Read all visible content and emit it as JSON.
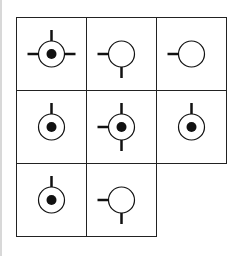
{
  "puzzle": {
    "grid": {
      "rows": 3,
      "cols": 3,
      "origin": [
        16,
        17
      ],
      "cell_w": 70,
      "cell_h": 73
    },
    "colors": {
      "line": "#222222",
      "stroke": "#111111",
      "dot": "#111111",
      "background": "#ffffff"
    },
    "cells": [
      {
        "row": 0,
        "col": 0,
        "dot": true,
        "stubs": [
          "top",
          "left",
          "right"
        ]
      },
      {
        "row": 0,
        "col": 1,
        "dot": false,
        "stubs": [
          "left",
          "bottom"
        ]
      },
      {
        "row": 0,
        "col": 2,
        "dot": false,
        "stubs": [
          "left"
        ]
      },
      {
        "row": 1,
        "col": 0,
        "dot": true,
        "stubs": [
          "top"
        ]
      },
      {
        "row": 1,
        "col": 1,
        "dot": true,
        "stubs": [
          "top",
          "left",
          "bottom"
        ]
      },
      {
        "row": 1,
        "col": 2,
        "dot": true,
        "stubs": [
          "top"
        ]
      },
      {
        "row": 2,
        "col": 0,
        "dot": true,
        "stubs": [
          "top"
        ]
      },
      {
        "row": 2,
        "col": 1,
        "dot": false,
        "stubs": [
          "left",
          "bottom"
        ]
      }
    ],
    "missing_cell": {
      "row": 2,
      "col": 2
    }
  }
}
